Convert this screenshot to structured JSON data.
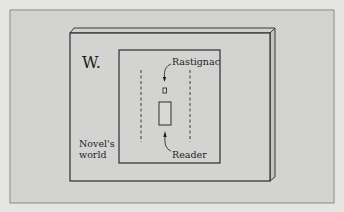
{
  "diagram": {
    "slab_label": "W.",
    "world_label_line1": "Novel's",
    "world_label_line2": "world",
    "character_label": "Rastignac",
    "reader_label": "Reader"
  },
  "colors": {
    "background": "#d3d3d1",
    "page": "#e4e4e2",
    "stroke": "#3a3a3a"
  }
}
